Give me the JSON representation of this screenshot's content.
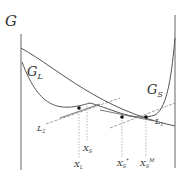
{
  "diagram": {
    "axis_label": "G",
    "curves": [
      {
        "id": "GL",
        "label": "G",
        "subscript": "L"
      },
      {
        "id": "GS",
        "label": "G",
        "subscript": "S"
      }
    ],
    "tangent_lines": [
      {
        "id": "L2",
        "label": "L",
        "subscript": "2"
      },
      {
        "id": "L1",
        "label": "L",
        "subscript": "1"
      }
    ],
    "points": [
      {
        "id": "XL",
        "label": "X",
        "subscript": "L",
        "superscript": ""
      },
      {
        "id": "XS",
        "label": "X",
        "subscript": "S",
        "superscript": ""
      },
      {
        "id": "XSstar",
        "label": "X",
        "subscript": "S",
        "superscript": "*"
      },
      {
        "id": "XSM",
        "label": "X",
        "subscript": "S",
        "superscript": "M"
      }
    ],
    "colors": {
      "curve": "#555555",
      "axis": "#666666",
      "dashed": "#999999",
      "dot": "#111111"
    }
  }
}
